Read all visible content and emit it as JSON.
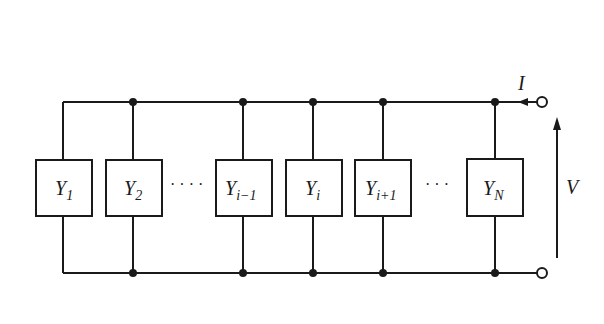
{
  "diagram": {
    "type": "parallel-admittance-circuit",
    "current_label": "I",
    "voltage_label": "V",
    "ellipsis_left": "· · · ·",
    "ellipsis_right": "· · ·",
    "elements": [
      {
        "base": "Y",
        "sub": "1"
      },
      {
        "base": "Y",
        "sub": "2"
      },
      {
        "base": "Y",
        "sub": "i−1"
      },
      {
        "base": "Y",
        "sub": "i"
      },
      {
        "base": "Y",
        "sub": "i+1"
      },
      {
        "base": "Y",
        "sub": "N"
      }
    ],
    "colors": {
      "line": "#1a1a1a",
      "background": "#ffffff"
    }
  }
}
